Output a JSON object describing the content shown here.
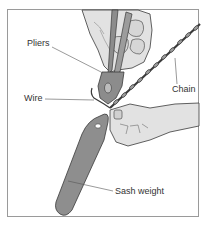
{
  "figure": {
    "labels": {
      "pliers": "Pliers",
      "wire": "Wire",
      "chain": "Chain",
      "sash_weight": "Sash weight"
    },
    "colors": {
      "frame": "#9a9a9a",
      "outline": "#3a3a3a",
      "skin": "#e2e2e2",
      "skin_shadow": "#bdbdbd",
      "metal": "#8c8c8c",
      "weight": "#8e8e8e",
      "leader": "#555555"
    }
  }
}
